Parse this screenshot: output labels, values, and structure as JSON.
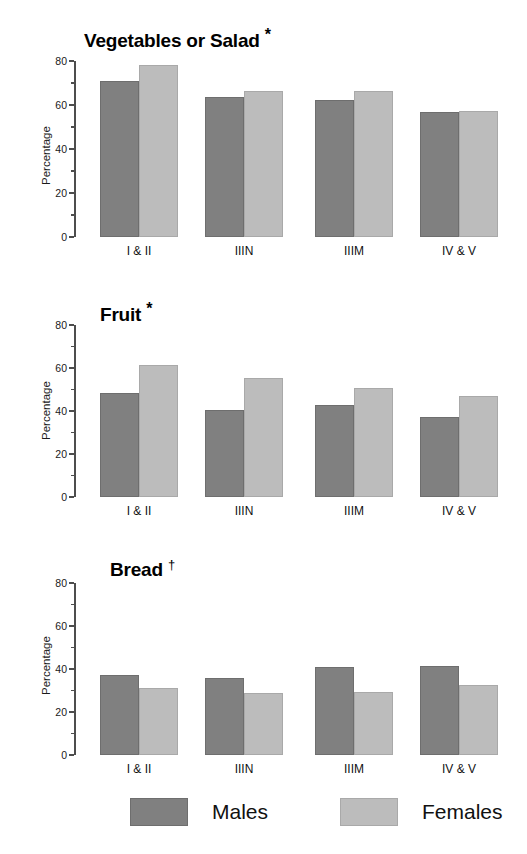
{
  "figure": {
    "ylabel": "Percentage",
    "categories": [
      "I & II",
      "IIIN",
      "IIIM",
      "IV & V"
    ],
    "y_ticks": [
      "0",
      "20",
      "40",
      "60",
      "80"
    ],
    "colors": {
      "males": "#808080",
      "females": "#bcbcbc",
      "axis": "#4d4d4d",
      "text": "#111111",
      "background": "#ffffff"
    }
  },
  "legend": {
    "items": [
      {
        "label": "Males",
        "swatch": "males-swatch"
      },
      {
        "label": "Females",
        "swatch": "females-swatch"
      }
    ]
  },
  "chart_data": [
    {
      "type": "bar",
      "title": "Vegetables or Salad *",
      "title_text": "Vegetables or Salad",
      "significance_marker": "*",
      "xlabel": "",
      "ylabel": "Percentage",
      "ylim": [
        0,
        80
      ],
      "yticks": [
        0,
        20,
        40,
        60,
        80
      ],
      "grid": false,
      "legend_position": "bottom",
      "categories": [
        "I & II",
        "IIIN",
        "IIIM",
        "IV & V"
      ],
      "series": [
        {
          "name": "Males",
          "values": [
            71,
            63.5,
            62.5,
            57
          ]
        },
        {
          "name": "Females",
          "values": [
            78,
            66.5,
            66.5,
            57.5
          ]
        }
      ]
    },
    {
      "type": "bar",
      "title": "Fruit *",
      "title_text": "Fruit",
      "significance_marker": "*",
      "xlabel": "",
      "ylabel": "Percentage",
      "ylim": [
        0,
        80
      ],
      "yticks": [
        0,
        20,
        40,
        60,
        80
      ],
      "grid": false,
      "legend_position": "bottom",
      "categories": [
        "I & II",
        "IIIN",
        "IIIM",
        "IV & V"
      ],
      "series": [
        {
          "name": "Males",
          "values": [
            48.5,
            40.5,
            43,
            37
          ]
        },
        {
          "name": "Females",
          "values": [
            61.5,
            55.5,
            50.5,
            47
          ]
        }
      ]
    },
    {
      "type": "bar",
      "title": "Bread †",
      "title_text": "Bread",
      "significance_marker": "†",
      "xlabel": "",
      "ylabel": "Percentage",
      "ylim": [
        0,
        80
      ],
      "yticks": [
        0,
        20,
        40,
        60,
        80
      ],
      "grid": false,
      "legend_position": "bottom",
      "categories": [
        "I & II",
        "IIIN",
        "IIIM",
        "IV & V"
      ],
      "series": [
        {
          "name": "Males",
          "values": [
            37,
            36,
            41,
            41.5
          ]
        },
        {
          "name": "Females",
          "values": [
            31,
            29,
            29.5,
            32.5
          ]
        }
      ]
    }
  ]
}
